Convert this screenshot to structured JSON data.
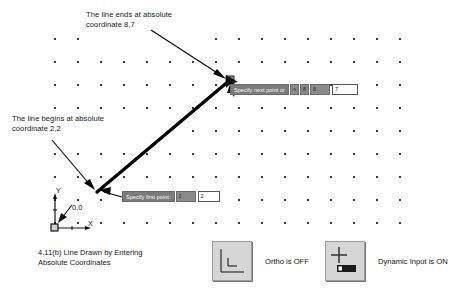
{
  "figure": {
    "caption": "4.11(b) Line Drawn by Entering\nAbsolute Coordinates"
  },
  "annotations": {
    "end_point": "The line ends at absolute\ncoordinate 8,7",
    "start_point": "The line begins at absolute\ncoordinate 2,2"
  },
  "ucs_icon": {
    "y_axis_label": "Y",
    "x_axis_label": "X",
    "origin_label": "0,0"
  },
  "tooltips": {
    "next_point": {
      "prompt": "Specify next point or",
      "chip_1": "n",
      "chip_2": "8",
      "chip_3": "8",
      "chip_4": ",",
      "field_value": "7"
    },
    "first_point": {
      "prompt": "Specify first point:",
      "chip_1": "2",
      "chip_2": ",",
      "field_value": "2"
    }
  },
  "status_toggles": [
    {
      "icon": "ortho-right-angle-icon",
      "label": "Ortho is OFF",
      "state": "OFF"
    },
    {
      "icon": "dynamic-input-crosshair-icon",
      "label": "Dynamic Input is ON",
      "state": "ON"
    }
  ],
  "drawing": {
    "line_start_px": [
      97,
      192
    ],
    "line_end_px": [
      230,
      80
    ],
    "line_color": "#000000",
    "grid_dot_color": "#3a3a3a",
    "grid_origin_px": [
      54,
      38
    ],
    "grid_spacing_px": 23,
    "grid_cols": 16,
    "grid_rows": 9
  },
  "colors": {
    "background": "#ffffff",
    "tooltip_bg": "#7b7b7b",
    "tooltip_chip": "#8a8a8a",
    "button_face": "#d6d6d6",
    "text": "#1a1a1a"
  }
}
